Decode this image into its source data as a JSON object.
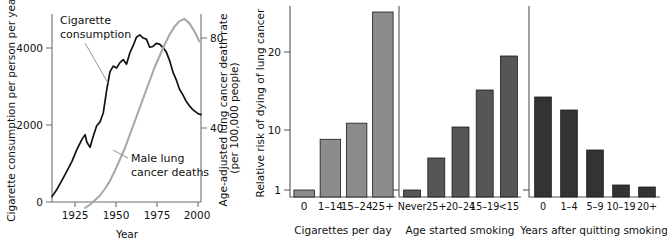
{
  "figure": {
    "panels": [
      "cigarette-consumption-vs-lung-cancer",
      "cigarettes-per-day",
      "age-started-smoking",
      "years-after-quitting-smoking"
    ]
  },
  "chart_data": [
    {
      "type": "line",
      "title": "",
      "xlabel": "Year",
      "ylabel": "Cigarette consumption per person per year",
      "y2label": "Age-adjusted lung cancer death rate",
      "y2sublabel": "(per 100,000 people)",
      "xlim": [
        1910,
        2000
      ],
      "ylim": [
        0,
        4800
      ],
      "y2lim": [
        0,
        96
      ],
      "xticks": [
        "1925",
        "1950",
        "1975",
        "2000"
      ],
      "xtickvalues": [
        1925,
        1950,
        1975,
        2000
      ],
      "yticks": [
        "0",
        "2000",
        "4000"
      ],
      "ytickvalues": [
        0,
        2000,
        4000
      ],
      "y2ticks": [
        "40",
        "80"
      ],
      "y2tickvalues": [
        40,
        80
      ],
      "grid": false,
      "legend": "inline-annotations",
      "annotations": [
        {
          "text": "Cigarette consumption",
          "series": "cigarette_consumption"
        },
        {
          "text": "Male lung cancer deaths",
          "series": "male_lung_cancer_deaths"
        }
      ],
      "series": [
        {
          "name": "Cigarette consumption",
          "color": "#111111",
          "axis": "left",
          "x": [
            1910,
            1913,
            1916,
            1919,
            1922,
            1925,
            1928,
            1930,
            1931,
            1933,
            1935,
            1937,
            1939,
            1941,
            1943,
            1945,
            1947,
            1949,
            1951,
            1953,
            1955,
            1957,
            1959,
            1961,
            1963,
            1965,
            1967,
            1969,
            1971,
            1973,
            1975,
            1977,
            1979,
            1981,
            1983,
            1985,
            1987,
            1989,
            1991,
            1993,
            1995,
            1998,
            2000
          ],
          "values": [
            140,
            330,
            560,
            800,
            1050,
            1360,
            1620,
            1750,
            1560,
            1420,
            1720,
            1980,
            2080,
            2320,
            2900,
            3380,
            3530,
            3480,
            3620,
            3700,
            3580,
            3870,
            4060,
            4280,
            4340,
            4260,
            4230,
            4020,
            4040,
            4120,
            4100,
            4010,
            3900,
            3680,
            3380,
            3180,
            2930,
            2790,
            2620,
            2500,
            2400,
            2300,
            2270
          ]
        },
        {
          "name": "Male lung cancer deaths",
          "color": "#a8a8a8",
          "axis": "right",
          "x": [
            1930,
            1933,
            1936,
            1939,
            1942,
            1945,
            1948,
            1951,
            1954,
            1957,
            1960,
            1963,
            1966,
            1969,
            1972,
            1975,
            1978,
            1981,
            1984,
            1987,
            1990,
            1993,
            1996,
            1999
          ],
          "values": [
            4.5,
            6.0,
            8.0,
            10.0,
            13.0,
            16.5,
            21.0,
            26.0,
            31.0,
            37.0,
            43.0,
            49.0,
            55.0,
            61.0,
            67.0,
            72.0,
            77.0,
            81.5,
            85.0,
            87.5,
            88.5,
            86.5,
            83.0,
            78.5
          ]
        }
      ]
    },
    {
      "type": "bar",
      "title": "",
      "xlabel": "Cigarettes per day",
      "ylabel": "Relative risk of dying of lung cancer",
      "yscale": "log",
      "yticks": [
        "1",
        "10",
        "20"
      ],
      "ytickvalues": [
        1,
        10,
        20
      ],
      "ylim": [
        1,
        34
      ],
      "grid": false,
      "bar_color": "#8c8c8c",
      "categories": [
        "0",
        "1–14",
        "15–24",
        "25+"
      ],
      "values": [
        1,
        7,
        13,
        30
      ]
    },
    {
      "type": "bar",
      "title": "",
      "xlabel": "Age started smoking",
      "ylabel": "",
      "yscale": "log",
      "ylim": [
        1,
        34
      ],
      "grid": false,
      "bar_color": "#565656",
      "categories": [
        "Never",
        "25+",
        "20–24",
        "15–19",
        "<15"
      ],
      "values": [
        1,
        3,
        5.8,
        15,
        19
      ]
    },
    {
      "type": "bar",
      "title": "",
      "xlabel": "Years after quitting smoking",
      "ylabel": "",
      "yscale": "log",
      "ylim": [
        1,
        34
      ],
      "grid": false,
      "bar_color": "#333333",
      "categories": [
        "0",
        "1–4",
        "5–9",
        "10–19",
        "20+"
      ],
      "values": [
        14,
        12,
        5,
        1.3,
        1.2
      ]
    }
  ]
}
